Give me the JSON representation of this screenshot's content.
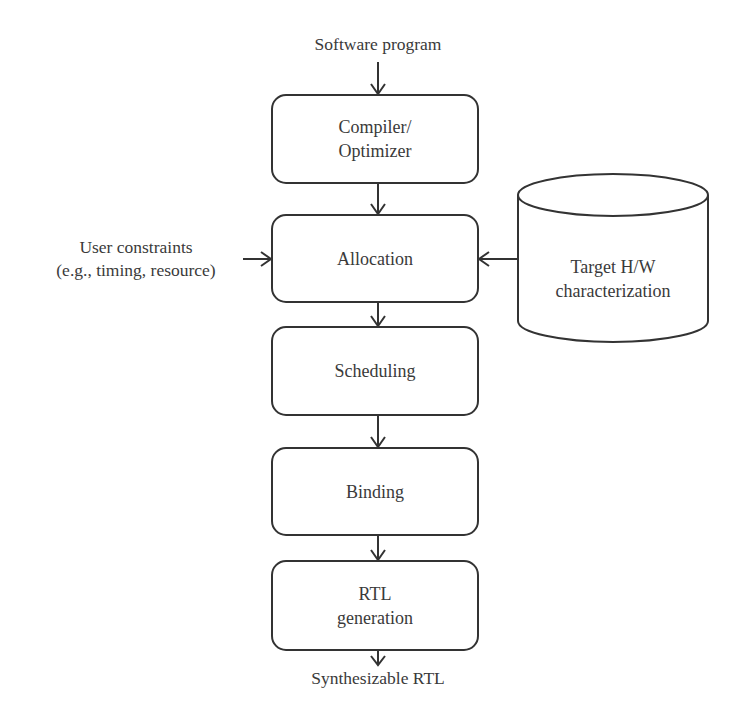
{
  "diagram": {
    "type": "flowchart",
    "input_label": "Software program",
    "output_label": "Synthesizable RTL",
    "side_input": {
      "line1": "User constraints",
      "line2": "(e.g., timing, resource)"
    },
    "database": {
      "line1": "Target H/W",
      "line2": "characterization"
    },
    "steps": [
      {
        "id": "compiler",
        "line1": "Compiler/",
        "line2": "Optimizer"
      },
      {
        "id": "allocation",
        "line1": "Allocation",
        "line2": ""
      },
      {
        "id": "scheduling",
        "line1": "Scheduling",
        "line2": ""
      },
      {
        "id": "binding",
        "line1": "Binding",
        "line2": ""
      },
      {
        "id": "rtl",
        "line1": "RTL",
        "line2": "generation"
      }
    ],
    "edges": [
      {
        "from": "Software program",
        "to": "compiler"
      },
      {
        "from": "compiler",
        "to": "allocation"
      },
      {
        "from": "User constraints",
        "to": "allocation"
      },
      {
        "from": "Target H/W characterization",
        "to": "allocation"
      },
      {
        "from": "allocation",
        "to": "scheduling"
      },
      {
        "from": "scheduling",
        "to": "binding"
      },
      {
        "from": "binding",
        "to": "rtl"
      },
      {
        "from": "rtl",
        "to": "Synthesizable RTL"
      }
    ],
    "colors": {
      "stroke": "#333333",
      "text": "#3a3a3a",
      "background": "#ffffff"
    }
  }
}
